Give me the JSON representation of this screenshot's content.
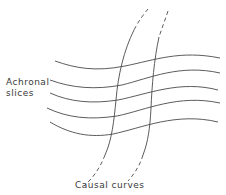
{
  "figure": {
    "labels": {
      "achronal_line1": "Achronal",
      "achronal_line2": "slices",
      "causal": "Causal curves"
    },
    "achronal_slices": [
      {
        "name": "slice-1",
        "path": "M55,61 C75,68 95,72 125,66 C155,60 180,50 220,58"
      },
      {
        "name": "slice-2",
        "path": "M50,80 C72,88 95,90 122,85 C150,78 180,64 220,73"
      },
      {
        "name": "slice-3",
        "path": "M50,93 C70,102 92,104 118,100 C148,94 180,80 218,90"
      },
      {
        "name": "slice-4",
        "path": "M47,108 C68,118 90,120 117,116 C146,110 178,94 220,103"
      },
      {
        "name": "slice-5",
        "path": "M50,122 C70,134 90,138 113,134 C142,128 176,112 218,122"
      }
    ],
    "causal_curves": [
      {
        "name": "causal-curve-1",
        "dashed_top": "M148,9 C143,15 138,22 134,30",
        "solid": "M134,30 C124,50 118,75 116,100 C114,120 112,140 105,155",
        "dashed_bottom": "M105,155 C100,168 93,178 84,186"
      },
      {
        "name": "causal-curve-2",
        "dashed_top": "M168,11 C165,20 162,28 159,37",
        "solid": "M159,37 C154,60 152,85 151,108 C150,128 148,142 143,155",
        "dashed_bottom": "M143,155 C140,165 135,173 128,181"
      }
    ],
    "colors": {
      "stroke": "#4a4a4a",
      "text": "#3a3a3a",
      "background": "#ffffff"
    }
  }
}
